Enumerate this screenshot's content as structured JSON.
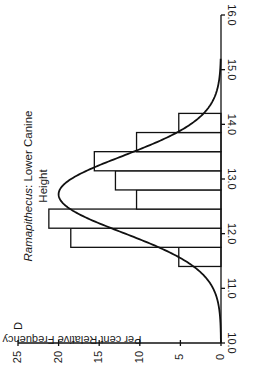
{
  "chart_data": {
    "type": "bar",
    "orientation": "rotated 90deg clockwise (x-axis runs bottom-to-top on right edge, values extend leftward)",
    "panel_label": "D",
    "title": "Ramapithecus: Lower Canine Height",
    "title_italic_part": "Ramapithecus",
    "title_line1_rest": ": Lower Canine",
    "title_line2": "Height",
    "xlabel": "",
    "ylabel": "Per cent Relative Frequency",
    "xlim": [
      10.0,
      16.0
    ],
    "ylim": [
      0,
      25
    ],
    "x_ticks": [
      "10.0",
      "11.0",
      "12.0",
      "13.0",
      "14.0",
      "15.0",
      "16.0"
    ],
    "y_ticks": [
      "0",
      "5",
      "10",
      "15",
      "20",
      "25"
    ],
    "bins": [
      {
        "from": 11.4,
        "to": 11.75,
        "value": 5.2
      },
      {
        "from": 11.75,
        "to": 12.1,
        "value": 18.5
      },
      {
        "from": 12.1,
        "to": 12.45,
        "value": 21.2
      },
      {
        "from": 12.45,
        "to": 12.8,
        "value": 10.4
      },
      {
        "from": 12.8,
        "to": 13.15,
        "value": 13.0
      },
      {
        "from": 13.15,
        "to": 13.5,
        "value": 15.6
      },
      {
        "from": 13.5,
        "to": 13.85,
        "value": 10.4
      },
      {
        "from": 13.85,
        "to": 14.2,
        "value": 5.2
      }
    ],
    "categories": [
      "11.4-11.75",
      "11.75-12.1",
      "12.1-12.45",
      "12.45-12.8",
      "12.8-13.15",
      "13.15-13.5",
      "13.5-13.85",
      "13.85-14.2"
    ],
    "values": [
      5.2,
      18.5,
      21.2,
      10.4,
      13.0,
      15.6,
      10.4,
      5.2
    ],
    "fitted_curve": {
      "type": "normal",
      "mean": 12.72,
      "peak": 20.0,
      "sd": 0.7
    },
    "grid": false,
    "legend": null
  }
}
